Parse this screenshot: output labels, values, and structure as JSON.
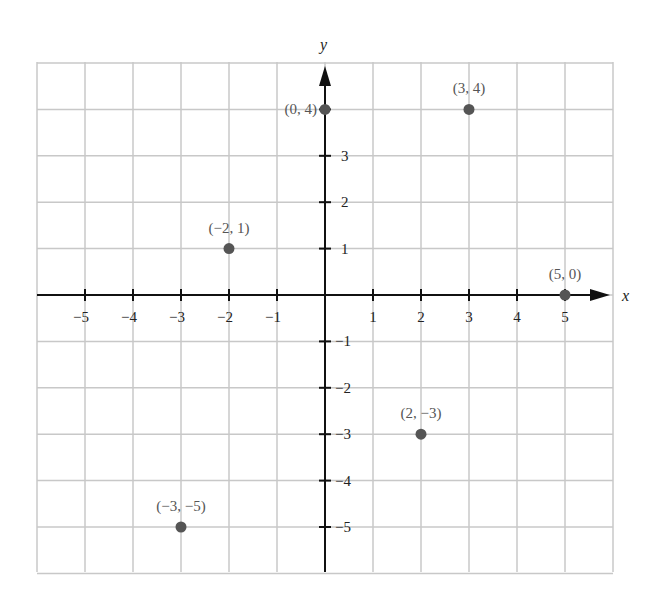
{
  "chart_data": {
    "type": "scatter",
    "title": "",
    "xlabel": "x",
    "ylabel": "y",
    "xlim": [
      -6,
      6
    ],
    "ylim": [
      -6,
      5
    ],
    "grid": true,
    "x_ticks": [
      -5,
      -4,
      -3,
      -2,
      -1,
      1,
      2,
      3,
      4,
      5
    ],
    "y_ticks": [
      -5,
      -4,
      -3,
      -2,
      -1,
      1,
      2,
      3
    ],
    "x_tick_labels": [
      "−5",
      "−4",
      "−3",
      "−2",
      "−1",
      "1",
      "2",
      "3",
      "4",
      "5"
    ],
    "y_tick_labels": [
      "−5",
      "−4",
      "−3",
      "−2",
      "−1",
      "1",
      "2",
      "3"
    ],
    "points": [
      {
        "x": 0,
        "y": 4,
        "label": "(0, 4)"
      },
      {
        "x": 3,
        "y": 4,
        "label": "(3, 4)"
      },
      {
        "x": -2,
        "y": 1,
        "label": "(−2, 1)"
      },
      {
        "x": 5,
        "y": 0,
        "label": "(5, 0)"
      },
      {
        "x": 2,
        "y": -3,
        "label": "(2, −3)"
      },
      {
        "x": -3,
        "y": -5,
        "label": "(−3, −5)"
      }
    ]
  },
  "colors": {
    "grid": "#c8c8c8",
    "axis": "#111111",
    "point": "#555555",
    "label": "#555555"
  }
}
